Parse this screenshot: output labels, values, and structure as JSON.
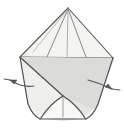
{
  "figure": {
    "title": "Folding step diagram: cone shaped fabric being flattened outward",
    "type": "line-drawing-diagram",
    "canvas": {
      "width": 124,
      "height": 132,
      "background": "#ffffff"
    },
    "palette": {
      "outline": "#4a4a4a",
      "outline_light": "#8a8a8a",
      "fill_light": "#ececeb",
      "fill_mid": "#e2e2e1",
      "fill_shadow": "#d8d8d7",
      "arrow": "#555555",
      "background": "#ffffff"
    },
    "key_points": {
      "apex": {
        "x": 68,
        "y": 8,
        "label": "apex"
      },
      "left_corner": {
        "x": 20,
        "y": 57,
        "label": "left-corner"
      },
      "right_corner": {
        "x": 113,
        "y": 58,
        "label": "right-corner"
      },
      "bottom_left": {
        "x": 40,
        "y": 118,
        "label": "bottom-left"
      },
      "bottom_right": {
        "x": 86,
        "y": 118,
        "label": "bottom-right"
      },
      "bottom_center": {
        "x": 63,
        "y": 96,
        "label": "bottom-center-peak"
      }
    },
    "parts": [
      {
        "name": "upper-cone",
        "description": "triangular cone from apex fanning to the two wide corners"
      },
      {
        "name": "cone-rib-left",
        "description": "interior fold line from apex toward lower left"
      },
      {
        "name": "cone-rib-center",
        "description": "vertical center fold line from apex"
      },
      {
        "name": "cone-rib-right",
        "description": "interior fold line from apex toward lower right"
      },
      {
        "name": "rim-band",
        "description": "horizontal rim band across the widest part"
      },
      {
        "name": "lower-skirt",
        "description": "flared lower body with rounded base"
      },
      {
        "name": "diagonal-fold",
        "description": "diagonal crease across lower body"
      },
      {
        "name": "base-tab",
        "description": "small pointed tab at the bottom"
      }
    ],
    "annotations": [
      {
        "name": "arrow-left",
        "direction": "left",
        "tip": {
          "x": 4,
          "y": 80
        },
        "tail": {
          "x": 34,
          "y": 86
        },
        "meaning": "pull outward to the left"
      },
      {
        "name": "arrow-right",
        "direction": "right",
        "tip": {
          "x": 120,
          "y": 88
        },
        "tail": {
          "x": 88,
          "y": 80
        },
        "meaning": "pull outward to the right"
      }
    ],
    "labels": []
  }
}
